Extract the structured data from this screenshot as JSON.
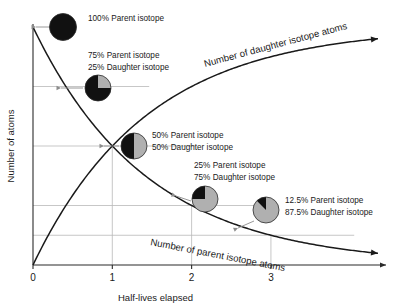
{
  "chart_data": {
    "type": "line",
    "title": "",
    "xlabel": "Half-lives elapsed",
    "ylabel": "Number of atoms",
    "xlim": [
      0,
      4.35
    ],
    "ylim": [
      0,
      1.0
    ],
    "xticks": [
      "0",
      "1",
      "2",
      "3"
    ],
    "xtick_values": [
      0,
      1,
      2,
      3
    ],
    "yticks": [],
    "grid": true,
    "grid_y_values": [
      0.75,
      0.5,
      0.25,
      0.125
    ],
    "grid_x_values": [
      1,
      2,
      3
    ],
    "legend_position": "inline-curve-labels",
    "x": [
      0,
      0.5,
      1,
      1.5,
      2,
      2.5,
      3,
      3.5,
      4,
      4.35
    ],
    "series": [
      {
        "name": "Number of parent isotope atoms",
        "values": [
          1.0,
          0.7071,
          0.5,
          0.3536,
          0.25,
          0.1768,
          0.125,
          0.0884,
          0.0625,
          0.0489
        ],
        "color": "#1a1a1a"
      },
      {
        "name": "Number of daughter isotope atoms",
        "values": [
          0.0,
          0.2929,
          0.5,
          0.6464,
          0.75,
          0.8232,
          0.875,
          0.9116,
          0.9375,
          0.9511
        ],
        "color": "#1a1a1a"
      }
    ],
    "annotations": [
      {
        "id": "p0",
        "half_lives": 0,
        "parent_fraction": 1.0,
        "lines": [
          "100% Parent isotope"
        ],
        "pie": {
          "cx": 63,
          "cy": 27,
          "r": 13.5,
          "parent_pct": 100,
          "start_angle": 0
        },
        "text_x": 88,
        "text_y": 21,
        "leader": {
          "x1": 58,
          "y1": 27,
          "x2": 36,
          "y2": 27
        },
        "grid_y": null
      },
      {
        "id": "p1",
        "half_lives": 1,
        "parent_fraction": 0.75,
        "lines": [
          "75% Parent isotope",
          "25% Daughter isotope"
        ],
        "pie": {
          "cx": 98,
          "cy": 88,
          "r": 13.0,
          "parent_pct": 75,
          "start_angle": 0
        },
        "text_x": 88,
        "text_y": 58,
        "leader": {
          "x1": 83,
          "y1": 88,
          "x2": 61,
          "y2": 88
        },
        "grid_y": 0.75
      },
      {
        "id": "p2",
        "half_lives": 2,
        "parent_fraction": 0.5,
        "lines": [
          "50% Parent isotope",
          "50% Daughter isotope"
        ],
        "pie": {
          "cx": 134,
          "cy": 146,
          "r": 13.0,
          "parent_pct": 50,
          "start_angle": 0
        },
        "text_x": 152,
        "text_y": 138,
        "leader": {
          "x1": 119,
          "y1": 146,
          "x2": 104,
          "y2": 146
        },
        "grid_y": 0.5
      },
      {
        "id": "p3",
        "half_lives": 3,
        "parent_fraction": 0.25,
        "lines": [
          "25% Parent isotope",
          "75% Daughter isotope"
        ],
        "pie": {
          "cx": 205,
          "cy": 199,
          "r": 13.0,
          "parent_pct": 25,
          "start_angle": 0
        },
        "text_x": 194,
        "text_y": 168,
        "leader": {
          "x1": 191,
          "y1": 201,
          "x2": 176,
          "y2": 196
        },
        "grid_y": 0.25
      },
      {
        "id": "p4",
        "half_lives": 4,
        "parent_fraction": 0.125,
        "lines": [
          "12.5% Parent isotope",
          "87.5% Daughter isotope"
        ],
        "pie": {
          "cx": 266,
          "cy": 210,
          "r": 13.0,
          "parent_pct": 12.5,
          "start_angle": 0
        },
        "text_x": 285,
        "text_y": 203,
        "leader": {
          "x1": 254,
          "y1": 221,
          "x2": 238,
          "y2": 228
        },
        "grid_y": 0.125
      }
    ],
    "curve_labels": [
      {
        "id": "daughter-curve-label",
        "text": "Number of daughter isotope atoms",
        "x": 205,
        "y": 67,
        "rotate": -15
      },
      {
        "id": "parent-curve-label",
        "text": "Number of parent isotope atoms",
        "x": 150,
        "y": 245,
        "rotate": 11
      }
    ]
  },
  "colors": {
    "parent_wedge": "#111111",
    "daughter_wedge": "#b0b0b0",
    "curve": "#1a1a1a",
    "grid": "#b9b9b9",
    "axis": "#2b2b2b",
    "leader": "#8c8c8c",
    "text": "#1a1a1a",
    "background": "#ffffff"
  }
}
